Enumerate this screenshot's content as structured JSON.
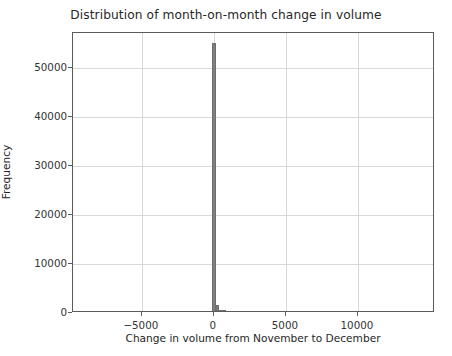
{
  "chart_data": {
    "type": "bar",
    "title": "Distribution of month-on-month change in volume",
    "xlabel": "Change in volume from November to December",
    "ylabel": "Frequency",
    "xlim": [
      -9780,
      15350
    ],
    "ylim": [
      0,
      57100
    ],
    "grid": true,
    "legend": null,
    "bar_color": "#808080",
    "grid_color": "#d9d9d9",
    "axis_color": "#5a5a5a",
    "xticks": [
      -5000,
      0,
      5000,
      10000
    ],
    "xticklabels": [
      "−5000",
      "0",
      "5000",
      "10000"
    ],
    "yticks": [
      0,
      10000,
      20000,
      30000,
      40000,
      50000
    ],
    "yticklabels": [
      "0",
      "10000",
      "20000",
      "30000",
      "40000",
      "50000"
    ],
    "bin_width": 250,
    "categories": [
      0,
      250,
      500,
      750
    ],
    "values": [
      54700,
      1300,
      260,
      90
    ],
    "bars": [
      {
        "x_left": -125,
        "x_right": 125,
        "height": 54700
      },
      {
        "x_left": 125,
        "x_right": 375,
        "height": 1300
      },
      {
        "x_left": 375,
        "x_right": 625,
        "height": 260
      },
      {
        "x_left": 625,
        "x_right": 875,
        "height": 90
      }
    ]
  }
}
